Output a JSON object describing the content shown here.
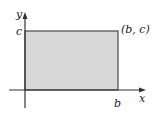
{
  "diagram": {
    "type": "coordinate-rectangle",
    "axes": {
      "x_label": "x",
      "y_label": "y"
    },
    "rectangle": {
      "corner_label": "(b, c)",
      "width_label": "b",
      "height_label": "c",
      "fill_color": "#d7d7d7",
      "stroke_color": "#555555"
    },
    "axis_color": "#333333"
  }
}
